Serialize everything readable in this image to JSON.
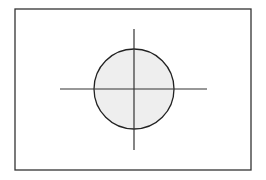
{
  "diagram": {
    "frame": {
      "x": 15,
      "y": 9,
      "width": 236,
      "height": 161,
      "stroke": "#333333"
    },
    "circle": {
      "cx": 134,
      "cy": 89,
      "r": 40,
      "fill": "#eeeeee",
      "stroke": "#222222"
    },
    "crosshair": {
      "horizontal": {
        "x1": 60,
        "y1": 89,
        "x2": 207,
        "y2": 89
      },
      "vertical": {
        "x1": 134,
        "y1": 29,
        "x2": 134,
        "y2": 150
      },
      "stroke": "#333333"
    }
  }
}
